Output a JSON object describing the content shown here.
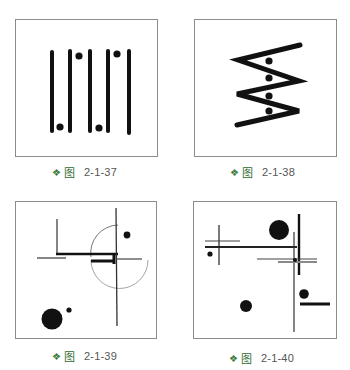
{
  "figures": [
    {
      "id": "fig-2-1-37",
      "caption": {
        "bullet": "❖",
        "word": "图",
        "number": "2-1-37"
      }
    },
    {
      "id": "fig-2-1-38",
      "caption": {
        "bullet": "❖",
        "word": "图",
        "number": "2-1-38"
      }
    },
    {
      "id": "fig-2-1-39",
      "caption": {
        "bullet": "❖",
        "word": "图",
        "number": "2-1-39"
      }
    },
    {
      "id": "fig-2-1-40",
      "caption": {
        "bullet": "❖",
        "word": "图",
        "number": "2-1-40"
      }
    }
  ],
  "colors": {
    "ink": "#111111",
    "frame": "#8c8c8c",
    "caption_accent": "#2f6b2f",
    "caption_text": "#555555"
  }
}
